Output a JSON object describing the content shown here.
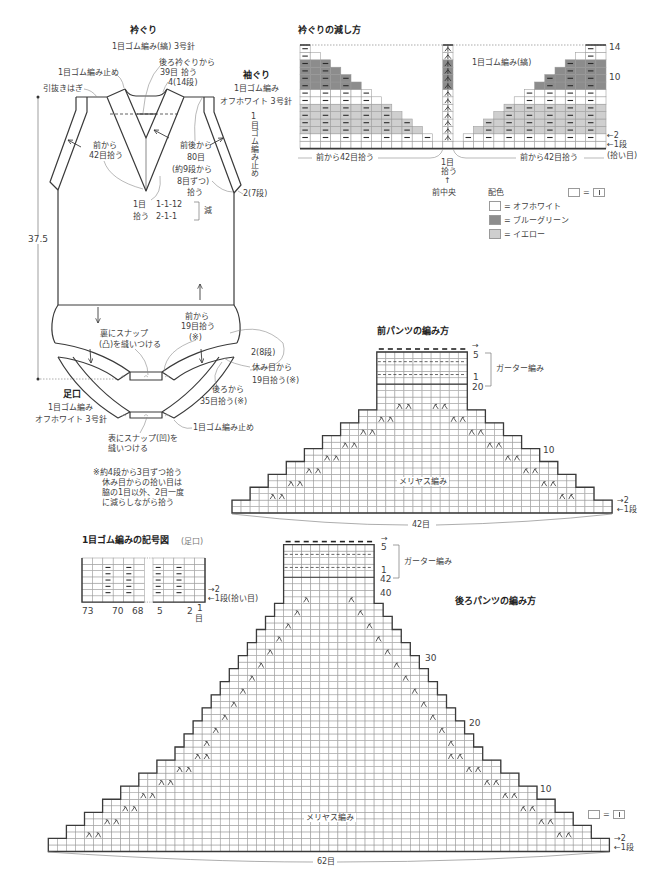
{
  "colors": {
    "off_white": "#ffffff",
    "blue_green": "#8c8c8c",
    "yellow": "#cfcfcf",
    "line": "#3a3a3a",
    "grid": "#9a9a9a"
  },
  "sketch": {
    "neckline": {
      "title": "衿ぐり",
      "spec": "1目ゴム編み(縞) 3号針",
      "bind_off": "1目ゴム編み止め",
      "shoulder_join": "引抜きはぎ",
      "back_pickup": [
        "後ろ衿ぐりから",
        "39目 拾う",
        "4(14段)"
      ],
      "front_pickup": [
        "前から",
        "42目拾う"
      ],
      "center_pickup": [
        "1目",
        "拾う"
      ],
      "decrease_schedule": [
        "1-1-12",
        "2-1-1"
      ],
      "decrease_label": "減"
    },
    "armhole": {
      "title": "袖ぐり",
      "stitch": "1目ゴム編み",
      "yarn_needle": "オフホワイト 3号針",
      "bind_off": "1目ゴム編み止め",
      "pickup": [
        "前後から",
        "80目",
        "(約9段から",
        "8目ずつ)",
        "拾う"
      ],
      "band_depth": "2(7段)"
    },
    "body_length": "37.5",
    "leg": {
      "title": "足口",
      "stitch": "1目ゴム編み",
      "yarn_needle": "オフホワイト 3号針",
      "bind_off": "1目ゴム編み止め",
      "front_pickup": [
        "前から",
        "19目拾う",
        "(※)"
      ],
      "held_pickup": [
        "休み目から",
        "19目拾う(※)"
      ],
      "back_pickup": [
        "後ろから",
        "35目拾う(※)"
      ],
      "band_depth": "2(8段)",
      "snap_inside": [
        "裏にスナップ",
        "(凸)を縫いつける"
      ],
      "snap_outside": [
        "表にスナップ(凹)を",
        "縫いつける"
      ]
    },
    "note": [
      "※約4段から3目ずつ拾う",
      "休み目からの拾い目は",
      "脇の1目以外、2目一度",
      "に減らしながら拾う"
    ]
  },
  "neckline_chart": {
    "title": "衿ぐりの減し方",
    "stitch_label": "1目ゴム編み(縞)",
    "rows": 14,
    "left_cols": 14,
    "right_cols": 15,
    "row_colors": [
      "off_white",
      "off_white",
      "yellow",
      "yellow",
      "yellow",
      "yellow",
      "off_white",
      "off_white",
      "blue_green",
      "blue_green",
      "blue_green",
      "blue_green",
      "off_white",
      "off_white"
    ],
    "row_labels": {
      "r14": "14",
      "r10": "10",
      "r2": "←2",
      "r1": "←1段",
      "r1_note": "(拾い目)"
    },
    "left_pickup": "前から42目拾う",
    "center_pickup": [
      "1目",
      "拾う"
    ],
    "right_pickup": "前から42目拾う",
    "center_front_arrow": "↑",
    "center_front": "前中央"
  },
  "legend": {
    "title": "配色",
    "knit_symbol_equals": "=",
    "items": [
      {
        "color": "off_white",
        "label": "= オフホワイト"
      },
      {
        "color": "blue_green",
        "label": "= ブルーグリーン"
      },
      {
        "color": "yellow",
        "label": "= イエロー"
      }
    ]
  },
  "front_pants": {
    "title": "前パンツの編み方",
    "cast_on_sts": 42,
    "stockinette_rows": 20,
    "garter_rows": 5,
    "top_sts": 10,
    "decreases": [
      {
        "start_row": 3,
        "every_rows": 2,
        "times": 8,
        "sts_each_side": 2
      }
    ],
    "labels": {
      "garter": "ガーター編み",
      "stockinette": "メリヤス編み",
      "width": "42目",
      "direction_arrow": "→",
      "garter_top": "5",
      "garter_bottom": "1",
      "stockinette_top": "20",
      "row10": "10",
      "row2": "→2",
      "row1": "←1段"
    }
  },
  "rib_chart": {
    "title": "1目ゴム編みの記号図",
    "title_note": "(足口)",
    "rows": 7,
    "left_block": {
      "cols": 6
    },
    "right_block": {
      "cols": 5
    },
    "col_labels": [
      "73",
      "70",
      "68",
      "5",
      "2",
      "1"
    ],
    "col_unit": "目",
    "row2": "→2",
    "row1": "←1段(拾い目)"
  },
  "back_pants": {
    "title": "後ろパンツの編み方",
    "cast_on_sts": 62,
    "stockinette_rows": 42,
    "garter_rows": 5,
    "top_sts": 10,
    "decreases": [
      {
        "start_row": 3,
        "every_rows": 2,
        "times": 7,
        "sts_each_side": 2
      },
      {
        "start_row": 17,
        "every_rows": 2,
        "times": 12,
        "sts_each_side": 1
      }
    ],
    "knit_symbol_equals": "=",
    "labels": {
      "garter": "ガーター編み",
      "stockinette": "メリヤス編み",
      "width": "62目",
      "direction_arrow": "→",
      "garter_top": "5",
      "garter_bottom": "1",
      "row42": "42",
      "row40": "40",
      "row30": "30",
      "row20": "20",
      "row10": "10",
      "row2": "→2",
      "row1": "←1段"
    }
  }
}
